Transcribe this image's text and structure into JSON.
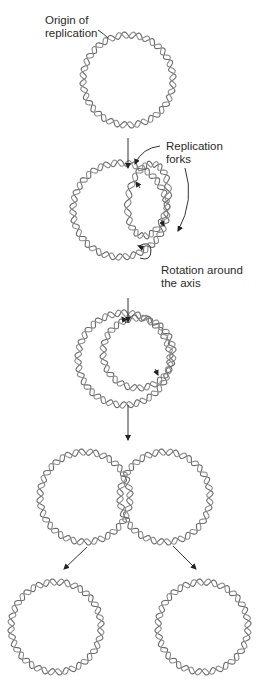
{
  "labels": {
    "origin": "Origin of replication",
    "origin_line1": "Origin of",
    "origin_line2": "replication",
    "forks_line1": "Replication",
    "forks_line2": "forks",
    "rotation_line1": "Rotation around",
    "rotation_line2": "the axis"
  },
  "stages": [
    {
      "id": 1,
      "description": "Parental circular DNA with origin of replication"
    },
    {
      "id": 2,
      "description": "Replication bubble with two replication forks; rotation around the axis"
    },
    {
      "id": 3,
      "description": "Replication progressing; forks move apart"
    },
    {
      "id": 4,
      "description": "Two interlinked daughter circles (catenane)"
    },
    {
      "id": 5,
      "description": "Two separated daughter circular DNA molecules"
    }
  ],
  "colors": {
    "strand": "#6a6a6a",
    "text": "#2a2a2a",
    "arrow": "#222222"
  }
}
